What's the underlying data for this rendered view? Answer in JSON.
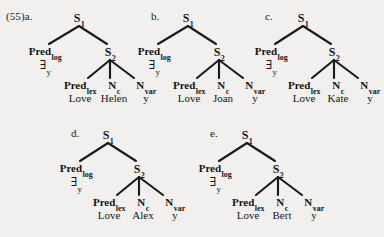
{
  "figure": {
    "example_number": "(55)",
    "background_color": "#f1f0ee",
    "ink_color": "#1a1a1a",
    "caption_prefix": "(55)",
    "trees": [
      {
        "id": "a",
        "label": "(55)a.",
        "root": "S",
        "root_sub": "1",
        "left_child": {
          "main": "Pred",
          "sub": "log",
          "word": "∃",
          "word_sub": "y"
        },
        "right_child": {
          "main": "S",
          "sub": "2"
        },
        "leaves": [
          {
            "main": "Pred",
            "sub": "lex",
            "word": "Love"
          },
          {
            "main": "N",
            "sub": "c",
            "word": "Helen"
          },
          {
            "main": "N",
            "sub": "var",
            "word": "y"
          }
        ]
      },
      {
        "id": "b",
        "label": "b.",
        "root": "S",
        "root_sub": "1",
        "left_child": {
          "main": "Pred",
          "sub": "log",
          "word": "∃",
          "word_sub": "y"
        },
        "right_child": {
          "main": "S",
          "sub": "2"
        },
        "leaves": [
          {
            "main": "Pred",
            "sub": "lex",
            "word": "Love"
          },
          {
            "main": "N",
            "sub": "c",
            "word": "Joan"
          },
          {
            "main": "N",
            "sub": "var",
            "word": "y"
          }
        ]
      },
      {
        "id": "c",
        "label": "c.",
        "root": "S",
        "root_sub": "1",
        "left_child": {
          "main": "Pred",
          "sub": "log",
          "word": "∃",
          "word_sub": "y"
        },
        "right_child": {
          "main": "S",
          "sub": "2"
        },
        "leaves": [
          {
            "main": "Pred",
            "sub": "lex",
            "word": "Love"
          },
          {
            "main": "N",
            "sub": "c",
            "word": "Kate"
          },
          {
            "main": "N",
            "sub": "var",
            "word": "y"
          }
        ]
      },
      {
        "id": "d",
        "label": "d.",
        "root": "S",
        "root_sub": "1",
        "left_child": {
          "main": "Pred",
          "sub": "log",
          "word": "∃",
          "word_sub": "y"
        },
        "right_child": {
          "main": "S",
          "sub": "2"
        },
        "leaves": [
          {
            "main": "Pred",
            "sub": "lex",
            "word": "Love"
          },
          {
            "main": "N",
            "sub": "c",
            "word": "Alex"
          },
          {
            "main": "N",
            "sub": "var",
            "word": "y"
          }
        ]
      },
      {
        "id": "e",
        "label": "e.",
        "root": "S",
        "root_sub": "1",
        "left_child": {
          "main": "Pred",
          "sub": "log",
          "word": "∃",
          "word_sub": "y"
        },
        "right_child": {
          "main": "S",
          "sub": "2"
        },
        "leaves": [
          {
            "main": "Pred",
            "sub": "lex",
            "word": "Love"
          },
          {
            "main": "N",
            "sub": "c",
            "word": "Bert"
          },
          {
            "main": "N",
            "sub": "var",
            "word": "y"
          }
        ]
      }
    ]
  }
}
